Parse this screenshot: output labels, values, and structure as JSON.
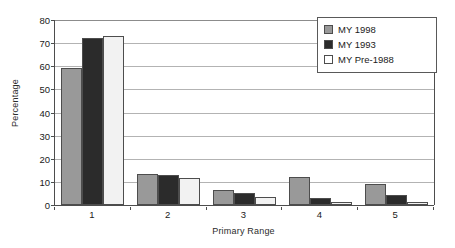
{
  "chart_data": {
    "type": "bar",
    "title": "",
    "xlabel": "Primary Range",
    "ylabel": "Percentage",
    "categories": [
      "1",
      "2",
      "3",
      "4",
      "5"
    ],
    "ylim": [
      0,
      80
    ],
    "yticks": [
      0,
      10,
      20,
      30,
      40,
      50,
      60,
      70,
      80
    ],
    "ytick_labels": [
      "0",
      "10",
      "20",
      "30",
      "40",
      "50",
      "60",
      "70",
      "80"
    ],
    "grid": "horizontal",
    "legend_position": "top-right",
    "series": [
      {
        "name": "MY 1998",
        "color": "#999999",
        "values": [
          59.3,
          13.3,
          6.7,
          12.0,
          9.3
        ]
      },
      {
        "name": "MY 1993",
        "color": "#2b2b2b",
        "values": [
          72.2,
          13.0,
          5.0,
          3.0,
          4.5
        ]
      },
      {
        "name": "MY Pre-1988",
        "color": "#f2f2f2",
        "values": [
          73.0,
          11.5,
          3.3,
          1.2,
          1.5
        ]
      }
    ]
  }
}
